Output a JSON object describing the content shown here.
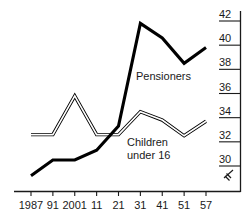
{
  "chart_data": {
    "type": "line",
    "title": "",
    "subtitle": "",
    "xlabel": "",
    "ylabel": "",
    "grid": false,
    "legend_position": "inline-annotation",
    "y_axis_position": "right",
    "y_axis_break": true,
    "y_break_symbol": "axis-break",
    "ylim": [
      28.6,
      42.8
    ],
    "yticks": [
      30,
      32,
      34,
      36,
      38,
      40,
      42
    ],
    "ytick_labels": [
      "30",
      "32",
      "34",
      "36",
      "38",
      "40",
      "42"
    ],
    "x": [
      1987,
      1991,
      2001,
      2011,
      2021,
      2031,
      2041,
      2051,
      2057
    ],
    "xtick_labels": [
      "1987",
      "91",
      "2001",
      "11",
      "21",
      "31",
      "41",
      "51",
      "57"
    ],
    "series": [
      {
        "name": "Pensioners",
        "style": "solid-thick",
        "label": "Pensioners",
        "values": [
          29.2,
          30.5,
          30.5,
          31.3,
          33.3,
          41.8,
          40.6,
          38.5,
          39.8
        ]
      },
      {
        "name": "Children under 16",
        "style": "hollow-double",
        "label_line1": "Children",
        "label_line2": "under 16",
        "values": [
          32.6,
          32.6,
          35.8,
          32.6,
          32.6,
          34.5,
          33.8,
          32.5,
          33.7
        ]
      }
    ],
    "colors": {
      "axis": "#1a1a1a",
      "pensioners": "#000000",
      "children_outline": "#000000",
      "children_fill": "#ffffff",
      "background": "#ffffff"
    }
  }
}
